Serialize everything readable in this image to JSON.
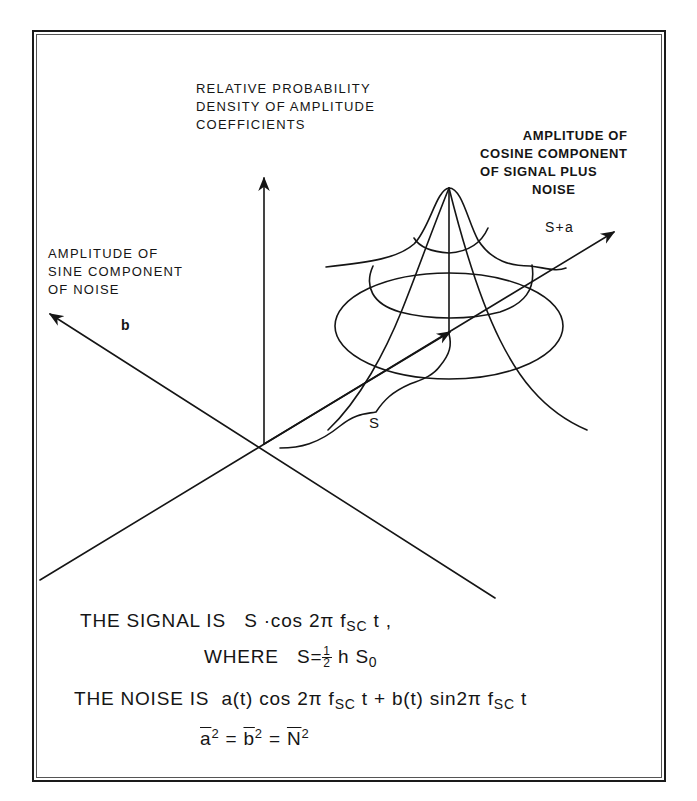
{
  "figure": {
    "labels": {
      "vertical_axis": [
        "RELATIVE PROBABILITY",
        "DENSITY OF AMPLITUDE",
        "COEFFICIENTS"
      ],
      "cosine_axis": [
        "AMPLITUDE OF",
        "COSINE COMPONENT",
        "OF SIGNAL PLUS",
        "NOISE"
      ],
      "sine_axis": [
        "AMPLITUDE OF",
        "SINE COMPONENT",
        "OF NOISE"
      ],
      "b_symbol": "b",
      "s_plus_a_symbol": "S+a",
      "s_symbol": "S"
    },
    "equations": {
      "line1": {
        "prefix": "THE  SIGNAL  IS",
        "expr": "S ·cos 2π f",
        "sub": "SC",
        "suffix": " t ,"
      },
      "line2": {
        "prefix": "WHERE",
        "lhs": "S=",
        "frac_num": "1",
        "frac_den": "2",
        "rhs": "h S",
        "rhs_sub": "0"
      },
      "line3": {
        "prefix": "THE  NOISE  IS",
        "part1": "a(t) cos 2π f",
        "sub1": "SC",
        "part2": " t + b(t) sin2π f",
        "sub2": "SC",
        "part3": " t"
      },
      "line4": {
        "a": "a",
        "b": "b",
        "n": "N",
        "exp": "2",
        "eq": " = "
      }
    },
    "colors": {
      "ink": "#151515",
      "paper": "#ffffff"
    }
  }
}
